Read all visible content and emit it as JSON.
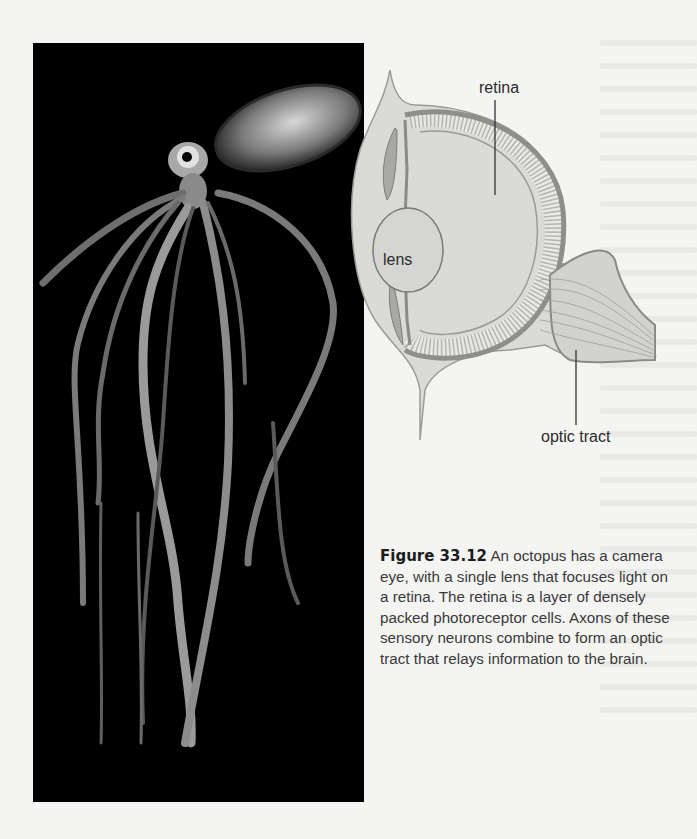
{
  "figure": {
    "number": "Figure 33.12",
    "caption": "An octopus has a camera eye, with a single lens that focuses light on a retina. The retina is a layer of densely packed photoreceptor cells. Axons of these sensory neurons combine to form an optic tract that relays information to the brain.",
    "photo": {
      "subject": "octopus",
      "background": "#000000"
    },
    "diagram": {
      "subject": "octopus camera eye cross-section",
      "labels": {
        "retina": "retina",
        "lens": "lens",
        "optic_tract": "optic tract"
      }
    }
  },
  "colors": {
    "page_background": "#f4f4f3",
    "diagram_fill": "#d9d9d7",
    "diagram_line": "#7a7a78",
    "label_text": "#2b2b2b",
    "caption_text": "#3a3a3a"
  }
}
